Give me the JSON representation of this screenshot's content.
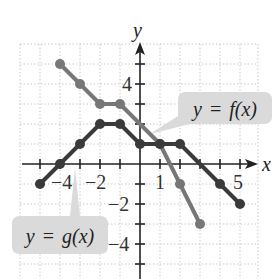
{
  "chart_data": {
    "type": "line",
    "title": "",
    "xlabel": "x",
    "ylabel": "y",
    "xlim": [
      -6,
      6
    ],
    "ylim": [
      -6,
      6
    ],
    "grid": true,
    "x_tick_labels": [
      {
        "value": -4,
        "label": "−4"
      },
      {
        "value": -2,
        "label": "−2"
      },
      {
        "value": 1,
        "label": "1"
      },
      {
        "value": 5,
        "label": "5"
      }
    ],
    "y_tick_labels": [
      {
        "value": 4,
        "label": "4"
      },
      {
        "value": -2,
        "label": "−2"
      },
      {
        "value": -4,
        "label": "−4"
      }
    ],
    "series": [
      {
        "name": "y = f(x)",
        "color": "#777777",
        "points": [
          [
            -4,
            5
          ],
          [
            -3,
            4
          ],
          [
            -2,
            3
          ],
          [
            -1,
            3
          ],
          [
            1,
            1
          ],
          [
            2,
            -1
          ],
          [
            3,
            -3
          ]
        ]
      },
      {
        "name": "y = g(x)",
        "color": "#3a3a3a",
        "points": [
          [
            -5,
            -1
          ],
          [
            -4,
            0
          ],
          [
            -3,
            1
          ],
          [
            -2,
            2
          ],
          [
            -1,
            2
          ],
          [
            0,
            1
          ],
          [
            1,
            1
          ],
          [
            2,
            1
          ],
          [
            4,
            -1
          ],
          [
            5,
            -2
          ]
        ]
      }
    ],
    "annotations": [
      {
        "text": "y = f(x)",
        "target": "f",
        "box_color": "#dadada"
      },
      {
        "text": "y = g(x)",
        "target": "g",
        "box_color": "#dadada"
      }
    ]
  },
  "labels": {
    "x_axis": "x",
    "y_axis": "y",
    "f_callout_y": "y",
    "f_callout_eq": "=",
    "f_callout_fx": "f(x)",
    "g_callout_y": "y",
    "g_callout_eq": "=",
    "g_callout_gx": "g(x)",
    "xt_m4": "−4",
    "xt_m2": "−2",
    "xt_1": "1",
    "xt_5": "5",
    "yt_4": "4",
    "yt_m2": "−2",
    "yt_m4": "−4"
  }
}
